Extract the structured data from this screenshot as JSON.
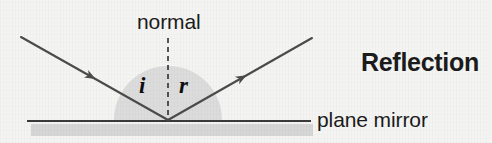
{
  "figure": {
    "title_label": "Reflection",
    "normal_label": "normal",
    "mirror_label": "plane mirror",
    "angle_incidence_label": "i",
    "angle_reflection_label": "r",
    "background_color": "#f4f4f3",
    "ray_color": "#4b4b4b",
    "line_color": "#3a3a3a",
    "text_color": "#1b1b1b",
    "wedge_fill": "#d9d9d9",
    "mirror_band_color": "#d6d6d6"
  },
  "geometry": {
    "vertex_x": 168,
    "vertex_y": 120,
    "incident_ray_start_x": 21,
    "incident_ray_start_y": 37,
    "reflected_ray_end_x": 312,
    "reflected_ray_end_y": 38,
    "normal_top_y": 38,
    "normal_x": 168,
    "mirror_left_x": 27,
    "mirror_right_x": 311,
    "mirror_y": 121,
    "wedge_radius": 54
  }
}
